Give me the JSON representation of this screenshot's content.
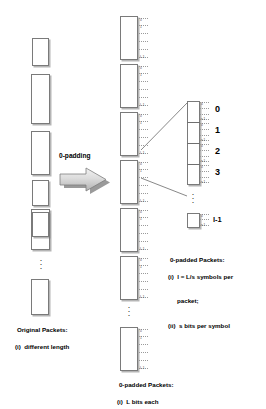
{
  "diagram": {
    "transform_label": "0-padding",
    "colors": {
      "box_border": "#7a7a7a",
      "box_fill": "#ffffff",
      "arrow_fill": "#cfcfcf",
      "text": "#000000",
      "tick": "#9a9a9a"
    }
  },
  "left_column": {
    "caption_title": "Original Packets:",
    "caption_items": [
      "(i)  different length"
    ],
    "ellipsis": "⋮",
    "packets": [
      {
        "index": 0,
        "label": "packet-1",
        "height": 28
      },
      {
        "index": 1,
        "label": "packet-2",
        "height": 50
      },
      {
        "index": 2,
        "label": "packet-3",
        "height": 44
      },
      {
        "index": 3,
        "label": "packet-4",
        "height": 26
      },
      {
        "index": 4,
        "label": "packet-5",
        "height": 41
      },
      {
        "index": 5,
        "label": "packet-6",
        "height": 25
      },
      {
        "index": 6,
        "label": "packet-n",
        "height": 36
      }
    ]
  },
  "middle_column": {
    "caption_title": "0-padded Packets:",
    "caption_items": [
      "(i)  L bits each"
    ],
    "ellipsis": "⋮",
    "bit_index_first": "0",
    "bit_index_second": "1",
    "bit_index_last": "L-1",
    "packet_count": 7,
    "packet_height": 44,
    "packets": [
      {
        "index": 0,
        "label": "padded-packet-1"
      },
      {
        "index": 1,
        "label": "padded-packet-2"
      },
      {
        "index": 2,
        "label": "padded-packet-3"
      },
      {
        "index": 3,
        "label": "padded-packet-4"
      },
      {
        "index": 4,
        "label": "padded-packet-5"
      },
      {
        "index": 5,
        "label": "padded-packet-6"
      },
      {
        "index": 6,
        "label": "padded-packet-n"
      }
    ]
  },
  "right_column": {
    "caption_title": "0-padded Packets:",
    "caption_items": [
      "(i)  l = L/s symbols per",
      "packet;",
      "(ii)  s bits per symbol"
    ],
    "caption_line1": "(i)  l = L/s symbols per",
    "caption_line2": "packet;",
    "caption_line3": "(ii)  s bits per symbol",
    "ellipsis": "⋮",
    "bit_index_first": "0",
    "bit_index_second": "1",
    "bit_index_last": "s-1",
    "symbols": [
      {
        "index": 0,
        "label": "0"
      },
      {
        "index": 1,
        "label": "1"
      },
      {
        "index": 2,
        "label": "2"
      },
      {
        "index": 3,
        "label": "3"
      }
    ],
    "last_symbol_label": "l-1"
  }
}
